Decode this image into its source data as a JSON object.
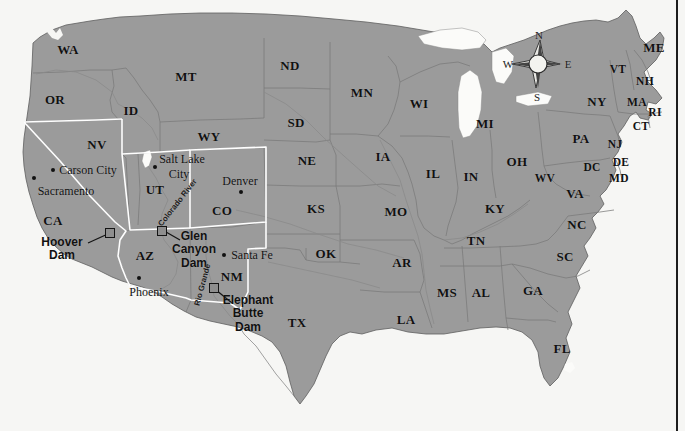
{
  "map": {
    "title": "United States map with states, capitals and major dams",
    "colors": {
      "land": "#9b9b9b",
      "background": "#f6f6f4",
      "state_border": "#7d7d7d",
      "highlight_border": "#ffffff",
      "label_text": "#111111",
      "rule": "#1d1d1d"
    }
  },
  "states": [
    {
      "code": "WA",
      "x": 68,
      "y": 50,
      "size": "md"
    },
    {
      "code": "OR",
      "x": 55,
      "y": 100,
      "size": "md"
    },
    {
      "code": "ID",
      "x": 131,
      "y": 111,
      "size": "md"
    },
    {
      "code": "MT",
      "x": 186,
      "y": 77,
      "size": "md"
    },
    {
      "code": "WY",
      "x": 209,
      "y": 137,
      "size": "md"
    },
    {
      "code": "NV",
      "x": 97,
      "y": 145,
      "size": "md"
    },
    {
      "code": "UT",
      "x": 155,
      "y": 190,
      "size": "md"
    },
    {
      "code": "CA",
      "x": 53,
      "y": 221,
      "size": "md"
    },
    {
      "code": "AZ",
      "x": 145,
      "y": 256,
      "size": "md"
    },
    {
      "code": "NM",
      "x": 232,
      "y": 277,
      "size": "md"
    },
    {
      "code": "CO",
      "x": 222,
      "y": 211,
      "size": "md"
    },
    {
      "code": "ND",
      "x": 290,
      "y": 66,
      "size": "md"
    },
    {
      "code": "SD",
      "x": 296,
      "y": 123,
      "size": "md"
    },
    {
      "code": "NE",
      "x": 307,
      "y": 161,
      "size": "md"
    },
    {
      "code": "KS",
      "x": 316,
      "y": 209,
      "size": "md"
    },
    {
      "code": "OK",
      "x": 326,
      "y": 254,
      "size": "md"
    },
    {
      "code": "TX",
      "x": 297,
      "y": 323,
      "size": "md"
    },
    {
      "code": "MN",
      "x": 362,
      "y": 93,
      "size": "md"
    },
    {
      "code": "IA",
      "x": 383,
      "y": 157,
      "size": "md"
    },
    {
      "code": "MO",
      "x": 396,
      "y": 212,
      "size": "md"
    },
    {
      "code": "AR",
      "x": 402,
      "y": 263,
      "size": "md"
    },
    {
      "code": "LA",
      "x": 406,
      "y": 320,
      "size": "md"
    },
    {
      "code": "WI",
      "x": 419,
      "y": 104,
      "size": "md"
    },
    {
      "code": "IL",
      "x": 433,
      "y": 174,
      "size": "md"
    },
    {
      "code": "MS",
      "x": 447,
      "y": 293,
      "size": "md"
    },
    {
      "code": "MI",
      "x": 485,
      "y": 124,
      "size": "md"
    },
    {
      "code": "IN",
      "x": 471,
      "y": 177,
      "size": "md"
    },
    {
      "code": "KY",
      "x": 495,
      "y": 209,
      "size": "md"
    },
    {
      "code": "TN",
      "x": 476,
      "y": 241,
      "size": "md"
    },
    {
      "code": "AL",
      "x": 481,
      "y": 293,
      "size": "md"
    },
    {
      "code": "GA",
      "x": 533,
      "y": 291,
      "size": "md"
    },
    {
      "code": "FL",
      "x": 562,
      "y": 349,
      "size": "md"
    },
    {
      "code": "OH",
      "x": 517,
      "y": 162,
      "size": "md"
    },
    {
      "code": "WV",
      "x": 545,
      "y": 179,
      "size": "sm"
    },
    {
      "code": "VA",
      "x": 575,
      "y": 194,
      "size": "md"
    },
    {
      "code": "NC",
      "x": 577,
      "y": 225,
      "size": "md"
    },
    {
      "code": "SC",
      "x": 565,
      "y": 257,
      "size": "md"
    },
    {
      "code": "PA",
      "x": 581,
      "y": 139,
      "size": "md"
    },
    {
      "code": "NY",
      "x": 597,
      "y": 102,
      "size": "md"
    },
    {
      "code": "NJ",
      "x": 615,
      "y": 145,
      "size": "sm"
    },
    {
      "code": "DE",
      "x": 621,
      "y": 163,
      "size": "sm"
    },
    {
      "code": "MD",
      "x": 619,
      "y": 179,
      "size": "sm"
    },
    {
      "code": "DC",
      "x": 592,
      "y": 168,
      "size": "sm"
    },
    {
      "code": "CT",
      "x": 641,
      "y": 127,
      "size": "sm"
    },
    {
      "code": "RI",
      "x": 655,
      "y": 113,
      "size": "sm"
    },
    {
      "code": "MA",
      "x": 637,
      "y": 103,
      "size": "sm"
    },
    {
      "code": "NH",
      "x": 645,
      "y": 82,
      "size": "sm"
    },
    {
      "code": "VT",
      "x": 618,
      "y": 70,
      "size": "sm"
    },
    {
      "code": "ME",
      "x": 654,
      "y": 48,
      "size": "md"
    }
  ],
  "cities": [
    {
      "name": "Sacramento",
      "label_x": 66,
      "label_y": 191,
      "dot_x": 34,
      "dot_y": 178,
      "anchor": "center"
    },
    {
      "name": "Carson City",
      "label_x": 88,
      "label_y": 170,
      "dot_x": 53,
      "dot_y": 170,
      "anchor": "center"
    },
    {
      "name": "Salt Lake",
      "label_x": 182,
      "label_y": 159,
      "dot_x": 155,
      "dot_y": 167,
      "anchor": "center"
    },
    {
      "name": "City",
      "label_x": 179,
      "label_y": 174,
      "dot_x": null,
      "dot_y": null,
      "anchor": "center"
    },
    {
      "name": "Denver",
      "label_x": 240,
      "label_y": 181,
      "dot_x": 241,
      "dot_y": 192,
      "anchor": "center"
    },
    {
      "name": "Phoenix",
      "label_x": 149,
      "label_y": 292,
      "dot_x": 139,
      "dot_y": 278,
      "anchor": "center"
    },
    {
      "name": "Santa Fe",
      "label_x": 252,
      "label_y": 255,
      "dot_x": 224,
      "dot_y": 255,
      "anchor": "center"
    }
  ],
  "dams": [
    {
      "name": "Hoover\nDam",
      "lines": [
        "Hoover",
        "Dam"
      ],
      "label_x": 62,
      "label_y": 249,
      "mark_x": 110,
      "mark_y": 233
    },
    {
      "name": "Glen\nCanyon\nDam",
      "lines": [
        "Glen",
        "Canyon",
        "Dam"
      ],
      "label_x": 194,
      "label_y": 250,
      "mark_x": 162,
      "mark_y": 231
    },
    {
      "name": "Elephant\nButte\nDam",
      "lines": [
        "Elephant",
        "Butte",
        "Dam"
      ],
      "label_x": 248,
      "label_y": 314,
      "mark_x": 214,
      "mark_y": 288
    }
  ],
  "rivers": [
    {
      "name": "Colorado River",
      "x": 178,
      "y": 203,
      "rotate": -52
    },
    {
      "name": "Rio Grande",
      "x": 203,
      "y": 285,
      "rotate": -75
    }
  ],
  "compass": {
    "center_x": 540,
    "center_y": 66,
    "north": "N",
    "south": "S",
    "east": "E",
    "west": "W"
  }
}
